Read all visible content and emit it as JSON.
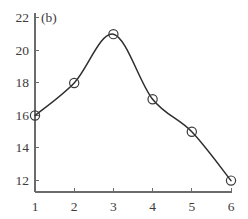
{
  "chart_data": {
    "type": "line",
    "title": "",
    "subtitle": "",
    "panel_label": "(b)",
    "xlabel": "",
    "ylabel": "",
    "x": [
      1,
      2,
      3,
      4,
      5,
      6
    ],
    "values": [
      16,
      18,
      21,
      17,
      15,
      12
    ],
    "series": [
      {
        "name": "",
        "x": [
          1,
          2,
          3,
          4,
          5,
          6
        ],
        "values": [
          16,
          18,
          21,
          17,
          15,
          12
        ]
      }
    ],
    "xlim": [
      1,
      6
    ],
    "ylim": [
      11.3,
      22.3
    ],
    "xticks": [
      1,
      2,
      3,
      4,
      5,
      6
    ],
    "yticks": [
      12,
      14,
      16,
      18,
      20,
      22
    ],
    "xtick_labels": [
      "1",
      "2",
      "3",
      "4",
      "5",
      "6"
    ],
    "ytick_labels": [
      "12",
      "14",
      "16",
      "18",
      "20",
      "22"
    ],
    "grid": false,
    "legend": false,
    "legend_position": "none",
    "marker": "open-circle",
    "interpolation": "smooth-spline",
    "line_color": "#2e2e2e",
    "marker_color": "#3a3a3a",
    "axis_color": "#6b6b6b",
    "background_color": "#ffffff",
    "annotations": []
  }
}
